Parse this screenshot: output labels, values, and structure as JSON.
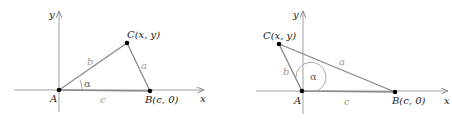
{
  "diagrams": [
    {
      "name": "acute-angle-triangle",
      "axes": {
        "x_label": "x",
        "y_label": "y"
      },
      "vertices": {
        "A": {
          "label": "A"
        },
        "B": {
          "label": "B",
          "coords": "(c, 0)"
        },
        "C": {
          "label": "C",
          "coords": "(x, y)"
        }
      },
      "sides": {
        "a": "a",
        "b": "b",
        "c": "c"
      },
      "angle": "α"
    },
    {
      "name": "obtuse-angle-triangle",
      "axes": {
        "x_label": "x",
        "y_label": "y"
      },
      "vertices": {
        "A": {
          "label": "A"
        },
        "B": {
          "label": "B",
          "coords": "(c, 0)"
        },
        "C": {
          "label": "C",
          "coords": "(x, y)"
        }
      },
      "sides": {
        "a": "a",
        "b": "b",
        "c": "c"
      },
      "angle": "α"
    }
  ],
  "colors": {
    "axis": "#9a9a9a",
    "triangle": "#8a8a8a",
    "point": "#000000",
    "text": "#1a1a1a",
    "side_label": "#9a9a9a"
  }
}
